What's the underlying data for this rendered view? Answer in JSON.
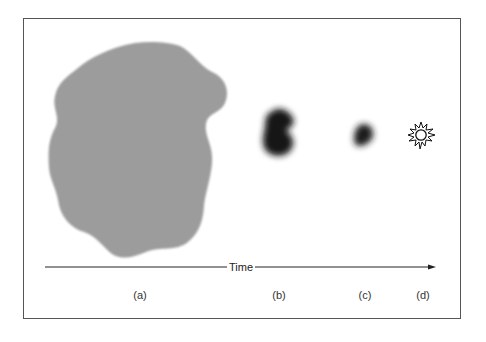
{
  "diagram": {
    "axis": {
      "label": "Time",
      "direction": "left-to-right"
    },
    "stages": [
      {
        "label": "(a)",
        "description": "large diffuse gray cloud",
        "color": "#9a9a9a"
      },
      {
        "label": "(b)",
        "description": "smaller dark dense clump",
        "color": "#1a1a1a"
      },
      {
        "label": "(c)",
        "description": "small dark clump",
        "color": "#222222"
      },
      {
        "label": "(d)",
        "description": "star",
        "icon": "star-burst-icon"
      }
    ]
  }
}
